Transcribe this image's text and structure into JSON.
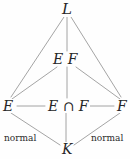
{
  "diagram": {
    "kind": "field-extension-lattice",
    "width": 130,
    "height": 159,
    "background_color": "#fefefe",
    "line_color": "#9a9a9a",
    "text_color": "#262626",
    "nodes": {
      "top": "L",
      "compositum": "E F",
      "left": "E",
      "intersection": "E ∩ F",
      "right": "F",
      "bottom": "K"
    },
    "annotations": {
      "left_edge": "normal",
      "right_edge": "normal"
    },
    "edges": [
      {
        "from": "L",
        "to": "E",
        "style": "diagonal"
      },
      {
        "from": "L",
        "to": "E F",
        "style": "vertical"
      },
      {
        "from": "L",
        "to": "F",
        "style": "diagonal"
      },
      {
        "from": "E F",
        "to": "E",
        "style": "diagonal"
      },
      {
        "from": "E F",
        "to": "E ∩ F",
        "style": "vertical"
      },
      {
        "from": "E F",
        "to": "F",
        "style": "diagonal"
      },
      {
        "from": "E",
        "to": "E ∩ F",
        "style": "horizontal"
      },
      {
        "from": "E ∩ F",
        "to": "F",
        "style": "horizontal"
      },
      {
        "from": "E",
        "to": "K",
        "style": "diagonal",
        "label": "normal"
      },
      {
        "from": "E ∩ F",
        "to": "K",
        "style": "vertical"
      },
      {
        "from": "F",
        "to": "K",
        "style": "diagonal",
        "label": "normal"
      }
    ]
  }
}
